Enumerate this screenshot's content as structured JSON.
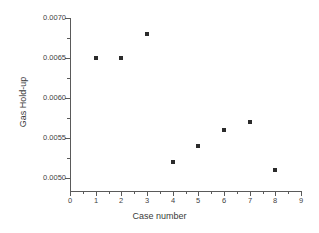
{
  "chart_data": {
    "type": "scatter",
    "title": "",
    "xlabel": "Case number",
    "ylabel": "Gas Hold-up",
    "xlim": [
      0,
      9
    ],
    "ylim": [
      0.005,
      0.007
    ],
    "grid": false,
    "legend": null,
    "marker": "filled-square",
    "marker_color": "#2b2b2b",
    "axis_color": "#5a5a5a",
    "background_color": "#ffffff",
    "x": [
      1,
      2,
      3,
      4,
      5,
      6,
      7,
      8
    ],
    "y": [
      0.0065,
      0.0065,
      0.0068,
      0.0052,
      0.0054,
      0.0056,
      0.0057,
      0.0051
    ],
    "points": [
      {
        "label": "case-1",
        "x": 1,
        "y": 0.0065
      },
      {
        "label": "case-2",
        "x": 2,
        "y": 0.0065
      },
      {
        "label": "case-3",
        "x": 3,
        "y": 0.0068
      },
      {
        "label": "case-4",
        "x": 4,
        "y": 0.0052
      },
      {
        "label": "case-5",
        "x": 5,
        "y": 0.0054
      },
      {
        "label": "case-6",
        "x": 6,
        "y": 0.0056
      },
      {
        "label": "case-7",
        "x": 7,
        "y": 0.0057
      },
      {
        "label": "case-8",
        "x": 8,
        "y": 0.0051
      }
    ],
    "xticks": [
      0,
      1,
      2,
      3,
      4,
      5,
      6,
      7,
      8,
      9
    ],
    "xtick_labels": [
      "0",
      "1",
      "2",
      "3",
      "4",
      "5",
      "6",
      "7",
      "8",
      "9"
    ],
    "xtick_minor_count_between": 1,
    "yticks": [
      0.005,
      0.0055,
      0.006,
      0.0065,
      0.007
    ],
    "ytick_labels": [
      "0.0050",
      "0.0055",
      "0.0060",
      "0.0065",
      "0.0070"
    ],
    "ytick_minor_count_between": 1
  }
}
